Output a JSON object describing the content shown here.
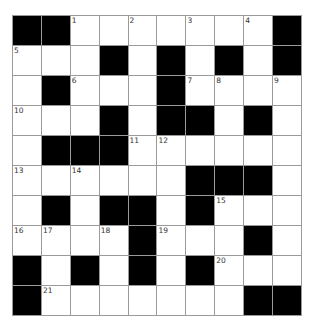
{
  "puzzle": {
    "rows": 10,
    "cols": 10,
    "colors": {
      "block": "#000000",
      "cell": "#ffffff",
      "grid_line": "#9a9a9a",
      "number": "#333333"
    },
    "grid": [
      [
        "#",
        "#",
        "1",
        "",
        "2",
        "",
        "3",
        "",
        "4",
        "#"
      ],
      [
        "5",
        "",
        "",
        "#",
        "",
        "#",
        "",
        "#",
        "",
        "#"
      ],
      [
        "",
        "#",
        "6",
        "",
        "",
        "#",
        "7",
        "8",
        "",
        "9"
      ],
      [
        "10",
        "",
        "",
        "#",
        "",
        "#",
        "#",
        "",
        "#",
        ""
      ],
      [
        "",
        "#",
        "#",
        "#",
        "11",
        "12",
        "",
        "",
        "",
        ""
      ],
      [
        "13",
        "",
        "14",
        "",
        "",
        "",
        "#",
        "#",
        "#",
        ""
      ],
      [
        "",
        "#",
        "",
        "#",
        "#",
        "",
        "#",
        "15",
        "",
        ""
      ],
      [
        "16",
        "17",
        "",
        "18",
        "#",
        "19",
        "",
        "",
        "#",
        ""
      ],
      [
        "#",
        "",
        "#",
        "",
        "#",
        "",
        "#",
        "20",
        "",
        ""
      ],
      [
        "#",
        "21",
        "",
        "",
        "",
        "",
        "",
        "",
        "#",
        "#"
      ]
    ]
  }
}
